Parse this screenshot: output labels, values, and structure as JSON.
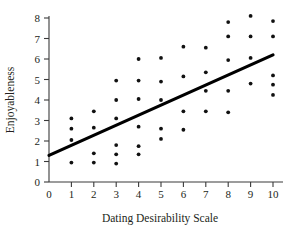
{
  "chart_data": {
    "type": "scatter",
    "title": "",
    "xlabel": "Dating Desirability Scale",
    "ylabel": "Enjoyableness",
    "xlim": [
      0,
      10.6
    ],
    "ylim": [
      0,
      8.45
    ],
    "grid": false,
    "legend": null,
    "xticks": [
      0,
      1,
      2,
      3,
      4,
      5,
      6,
      7,
      8,
      9,
      10
    ],
    "xtick_labels": [
      "0",
      "1",
      "2",
      "3",
      "4",
      "5",
      "6",
      "7",
      "8",
      "9",
      "10"
    ],
    "yticks": [
      0,
      1,
      2,
      3,
      4,
      5,
      6,
      7,
      8
    ],
    "ytick_labels": [
      "0",
      "1",
      "2",
      "3",
      "4",
      "5",
      "6",
      "7",
      "8"
    ],
    "point_color": "#111111",
    "line_color": "#000000",
    "axis_color": "#3a3a3a",
    "points": [
      {
        "x": 1,
        "y": 3.1
      },
      {
        "x": 1,
        "y": 2.6
      },
      {
        "x": 1,
        "y": 2.05
      },
      {
        "x": 1,
        "y": 0.95
      },
      {
        "x": 2,
        "y": 3.45
      },
      {
        "x": 2,
        "y": 2.65
      },
      {
        "x": 2,
        "y": 1.4
      },
      {
        "x": 2,
        "y": 0.95
      },
      {
        "x": 3,
        "y": 4.95
      },
      {
        "x": 3,
        "y": 4.0
      },
      {
        "x": 3,
        "y": 3.1
      },
      {
        "x": 3,
        "y": 1.8
      },
      {
        "x": 3,
        "y": 1.35
      },
      {
        "x": 3,
        "y": 0.9
      },
      {
        "x": 4,
        "y": 6.0
      },
      {
        "x": 4,
        "y": 4.95
      },
      {
        "x": 4,
        "y": 4.05
      },
      {
        "x": 4,
        "y": 2.7
      },
      {
        "x": 4,
        "y": 1.75
      },
      {
        "x": 4,
        "y": 1.35
      },
      {
        "x": 5,
        "y": 6.05
      },
      {
        "x": 5,
        "y": 4.9
      },
      {
        "x": 5,
        "y": 4.0
      },
      {
        "x": 5,
        "y": 2.6
      },
      {
        "x": 5,
        "y": 2.1
      },
      {
        "x": 6,
        "y": 6.6
      },
      {
        "x": 6,
        "y": 5.15
      },
      {
        "x": 6,
        "y": 3.45
      },
      {
        "x": 6,
        "y": 2.55
      },
      {
        "x": 7,
        "y": 6.55
      },
      {
        "x": 7,
        "y": 5.35
      },
      {
        "x": 7,
        "y": 4.45
      },
      {
        "x": 7,
        "y": 3.45
      },
      {
        "x": 8,
        "y": 7.8
      },
      {
        "x": 8,
        "y": 7.1
      },
      {
        "x": 8,
        "y": 5.95
      },
      {
        "x": 8,
        "y": 4.45
      },
      {
        "x": 8,
        "y": 3.4
      },
      {
        "x": 9,
        "y": 8.1
      },
      {
        "x": 9,
        "y": 7.1
      },
      {
        "x": 9,
        "y": 6.05
      },
      {
        "x": 9,
        "y": 4.8
      },
      {
        "x": 10,
        "y": 7.85
      },
      {
        "x": 10,
        "y": 7.1
      },
      {
        "x": 10,
        "y": 5.2
      },
      {
        "x": 10,
        "y": 4.75
      },
      {
        "x": 10,
        "y": 4.25
      }
    ],
    "regression_line": {
      "x0": 0,
      "y0": 1.3,
      "x1": 10,
      "y1": 6.2
    }
  }
}
